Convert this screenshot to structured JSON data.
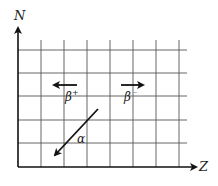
{
  "diagram": {
    "axes": {
      "y_label": "N",
      "x_label": "Z"
    },
    "grid": {
      "columns": 7,
      "rows": 5,
      "line_color": "#555555"
    },
    "arrows": [
      {
        "name": "beta-plus",
        "label": "β",
        "superscript": "+",
        "direction": "left"
      },
      {
        "name": "beta-minus",
        "label": "β",
        "superscript": "−",
        "direction": "right"
      },
      {
        "name": "alpha",
        "label": "α",
        "direction": "down-left"
      }
    ],
    "colors": {
      "ink": "#111111",
      "background": "#ffffff"
    }
  }
}
